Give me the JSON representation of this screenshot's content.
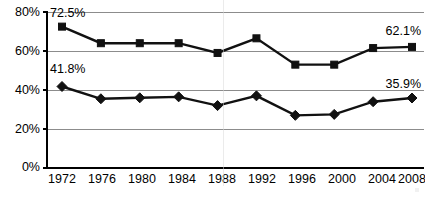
{
  "chart_data": {
    "type": "line",
    "title": "",
    "subtitle": "",
    "xlabel": "",
    "ylabel": "",
    "categories": [
      "1972",
      "1976",
      "1980",
      "1984",
      "1988",
      "1992",
      "1996",
      "2000",
      "2004",
      "2008"
    ],
    "x": [
      1972,
      1976,
      1980,
      1984,
      1988,
      1992,
      1996,
      2000,
      2004,
      2008
    ],
    "ylim": [
      0,
      80
    ],
    "yticks": [
      0,
      20,
      40,
      60,
      80
    ],
    "ytick_labels": [
      "0%",
      "20%",
      "40%",
      "60%",
      "80%"
    ],
    "grid": true,
    "grid_axis": "y",
    "legend_position": "bottom",
    "series": [
      {
        "name": "upper-series",
        "marker": "square",
        "color": "#111111",
        "values": [
          72.5,
          64.0,
          64.0,
          64.0,
          59.0,
          66.5,
          53.0,
          53.0,
          61.5,
          62.1
        ],
        "annotations": [
          {
            "index": 0,
            "text": "72.5%"
          },
          {
            "index": 9,
            "text": "62.1%"
          }
        ]
      },
      {
        "name": "lower-series",
        "marker": "diamond",
        "color": "#111111",
        "values": [
          41.8,
          35.5,
          36.0,
          36.5,
          32.0,
          37.0,
          27.0,
          27.5,
          34.0,
          35.9
        ],
        "annotations": [
          {
            "index": 0,
            "text": "41.8%"
          },
          {
            "index": 9,
            "text": "35.9%"
          }
        ]
      }
    ],
    "annotations_flat": [
      "72.5%",
      "41.8%",
      "62.1%",
      "35.9%"
    ]
  },
  "axes": {
    "y_labels": [
      "80%",
      "60%",
      "40%",
      "20%",
      "0%"
    ],
    "x_labels": [
      "1972",
      "1976",
      "1980",
      "1984",
      "1988",
      "1992",
      "1996",
      "2000",
      "2004",
      "2008"
    ]
  },
  "labels": {
    "upper_start": "72.5%",
    "upper_end": "62.1%",
    "lower_start": "41.8%",
    "lower_end": "35.9%"
  },
  "caption": {
    "text": ""
  },
  "colors": {
    "series": "#111111",
    "gridline": "#8c8c8c",
    "axis": "#000000",
    "background": "#ffffff"
  }
}
